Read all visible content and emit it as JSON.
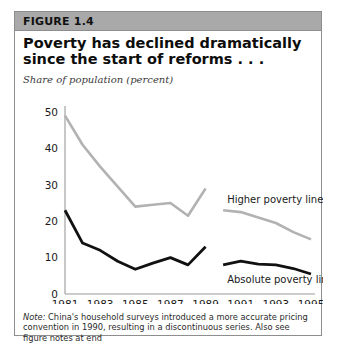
{
  "figure": {
    "label": "FIGURE 1.4",
    "title": "Poverty has declined dramatically since the start of reforms . . .",
    "axis_caption": "Share of population (percent)",
    "note_lead": "Note:",
    "note_body": " China's household surveys introduced a more accurate pricing convention in 1990, resulting in a discontinuous series. Also see figure notes at end",
    "note_truncated_line": "of chapter."
  },
  "colors": {
    "header_bar": "#a9a9a9",
    "frame_border": "#8e8e8e",
    "higher_line": "#b2b2b2",
    "absolute_line": "#111111",
    "axis": "#9a9a9a",
    "text": "#111111",
    "background": "#ffffff"
  },
  "chart_data": {
    "type": "line",
    "title": "Poverty has declined dramatically since the start of reforms . . .",
    "subtitle": "Share of population (percent)",
    "xlabel": "",
    "ylabel": "Share of population (percent)",
    "xlim": [
      1981,
      1995
    ],
    "ylim": [
      0,
      50
    ],
    "yticks": [
      0,
      10,
      20,
      30,
      40,
      50
    ],
    "xticks": [
      1981,
      1983,
      1985,
      1987,
      1989,
      1991,
      1993,
      1995
    ],
    "xtick_labels": [
      "1981",
      "1983",
      "1985",
      "1987",
      "1989",
      "1991",
      "1993",
      "1995"
    ],
    "ytick_labels": [
      "0",
      "10",
      "20",
      "30",
      "40",
      "50"
    ],
    "grid": false,
    "legend": "inline-annotations",
    "discontinuity": {
      "between": [
        1989,
        1990
      ],
      "reason": "China's household surveys introduced a more accurate pricing convention in 1990, resulting in a discontinuous series."
    },
    "series": [
      {
        "name": "Higher poverty line",
        "color": "#b2b2b2",
        "label_position": "right-upper",
        "segments": [
          {
            "x": [
              1981,
              1982,
              1983,
              1984,
              1985,
              1986,
              1987,
              1988,
              1989
            ],
            "values": [
              49.0,
              41.0,
              35.0,
              29.5,
              24.0,
              24.5,
              25.0,
              21.5,
              29.0
            ]
          },
          {
            "x": [
              1990,
              1991,
              1992,
              1993,
              1994,
              1995
            ],
            "values": [
              23.0,
              22.5,
              21.0,
              19.5,
              17.0,
              15.0
            ]
          }
        ]
      },
      {
        "name": "Absolute poverty line",
        "color": "#111111",
        "label_position": "right-lower",
        "segments": [
          {
            "x": [
              1981,
              1982,
              1983,
              1984,
              1985,
              1986,
              1987,
              1988,
              1989
            ],
            "values": [
              23.0,
              14.0,
              12.0,
              9.0,
              6.8,
              8.5,
              10.0,
              8.0,
              13.0
            ]
          },
          {
            "x": [
              1990,
              1991,
              1992,
              1993,
              1994,
              1995
            ],
            "values": [
              8.0,
              9.0,
              8.2,
              8.0,
              7.0,
              5.5
            ]
          }
        ]
      }
    ],
    "annotations": [
      {
        "text": "Higher poverty line",
        "series": "Higher poverty line"
      },
      {
        "text": "Absolute poverty line",
        "series": "Absolute poverty line"
      }
    ]
  }
}
